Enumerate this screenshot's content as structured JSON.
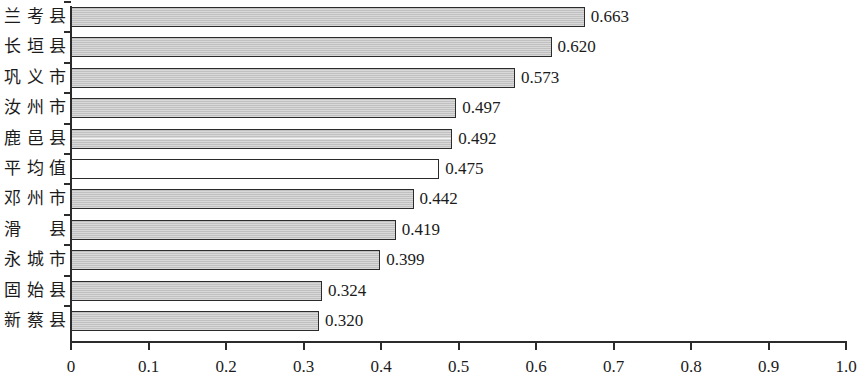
{
  "chart_data": {
    "type": "bar",
    "orientation": "horizontal",
    "title": "",
    "xlabel": "",
    "ylabel": "",
    "categories": [
      "兰考县",
      "长垣县",
      "巩义市",
      "汝州市",
      "鹿邑县",
      "平均值",
      "邓州市",
      "滑　县",
      "永城市",
      "固始县",
      "新蔡县"
    ],
    "values": [
      0.663,
      0.62,
      0.573,
      0.497,
      0.492,
      0.475,
      0.442,
      0.419,
      0.399,
      0.324,
      0.32
    ],
    "value_labels": [
      "0.663",
      "0.620",
      "0.573",
      "0.497",
      "0.492",
      "0.475",
      "0.442",
      "0.419",
      "0.399",
      "0.324",
      "0.320"
    ],
    "xlim": [
      0,
      1.0
    ],
    "xticks": [
      0,
      0.1,
      0.2,
      0.3,
      0.4,
      0.5,
      0.6,
      0.7,
      0.8,
      0.9,
      1.0
    ],
    "xtick_labels": [
      "0",
      "0.1",
      "0.2",
      "0.3",
      "0.4",
      "0.5",
      "0.6",
      "0.7",
      "0.8",
      "0.9",
      "1.0"
    ],
    "grid": false,
    "legend": "none",
    "bar_fill_color": "#c9c9c9",
    "bar_border_color": "#2b2b2b",
    "highlight_index": 5,
    "highlight_fill_color": "#ffffff",
    "highlight_note": "平均值 bar drawn unfilled (white)"
  }
}
